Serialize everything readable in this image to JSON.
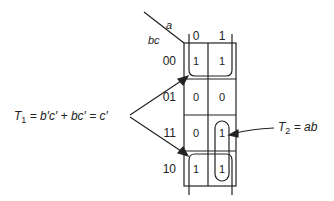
{
  "kmap": {
    "row_var": "bc",
    "col_var": "a",
    "col_labels": [
      "0",
      "1"
    ],
    "row_labels": [
      "00",
      "01",
      "11",
      "10"
    ],
    "cells": [
      [
        "1",
        "1"
      ],
      [
        "0",
        "0"
      ],
      [
        "0",
        "1"
      ],
      [
        "1",
        "1"
      ]
    ]
  },
  "annotations": {
    "t1": {
      "label": "T",
      "sub": "1",
      "expr": " = b′c′ + bc′ = c′"
    },
    "t2": {
      "label": "T",
      "sub": "2",
      "expr": " = ab"
    }
  },
  "colors": {
    "ink": "#222222",
    "background": "#ffffff"
  }
}
